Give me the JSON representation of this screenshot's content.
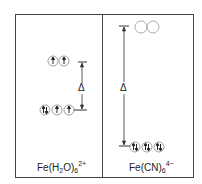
{
  "diagram": {
    "delta_symbol": "Δ",
    "panels": [
      {
        "name": "left",
        "label": {
          "base": "Fe(H",
          "sub1": "2",
          "mid": "O)",
          "sub2": "6",
          "sup": "2+"
        },
        "spin": "high-spin",
        "upper_orbitals": [
          "↑",
          "↑"
        ],
        "lower_orbitals": [
          "↑↓",
          "↑",
          "↑"
        ]
      },
      {
        "name": "right",
        "label": {
          "base": "Fe(CN)",
          "sub1": "6",
          "sup": "4−"
        },
        "spin": "low-spin",
        "upper_orbitals": [
          "",
          ""
        ],
        "lower_orbitals": [
          "↑↓",
          "↑↓",
          "↑↓"
        ]
      }
    ],
    "colors": {
      "line": "#333333",
      "circle": "#888888",
      "background": "#ffffff"
    }
  }
}
